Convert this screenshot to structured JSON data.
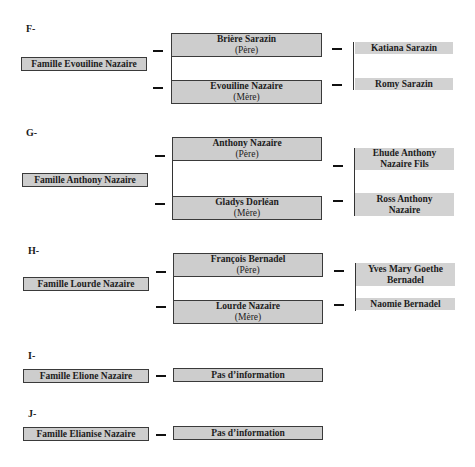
{
  "families": [
    {
      "letter": "F-",
      "family": "Famille Evouiline Nazaire",
      "father": {
        "name": "Brière Sarazin",
        "role": "(Père)"
      },
      "mother": {
        "name": "Evouiline Nazaire",
        "role": "(Mère)"
      },
      "children": [
        {
          "line1": "Katiana Sarazin",
          "line2": ""
        },
        {
          "line1": "Romy Sarazin",
          "line2": ""
        }
      ]
    },
    {
      "letter": "G-",
      "family": "Famille Anthony Nazaire",
      "father": {
        "name": "Anthony Nazaire",
        "role": "(Père)"
      },
      "mother": {
        "name": "Gladys Dorléan",
        "role": "(Mère)"
      },
      "children": [
        {
          "line1": "Ehude Anthony",
          "line2": "Nazaire Fils"
        },
        {
          "line1": "Ross Anthony",
          "line2": "Nazaire"
        }
      ]
    },
    {
      "letter": "H-",
      "family": "Famille Lourde Nazaire",
      "father": {
        "name": "François Bernadel",
        "role": "(Père)"
      },
      "mother": {
        "name": "Lourde Nazaire",
        "role": "(Mère)"
      },
      "children": [
        {
          "line1": "Yves Mary Goethe",
          "line2": "Bernadel"
        },
        {
          "line1": "Naomie Bernadel",
          "line2": ""
        }
      ]
    },
    {
      "letter": "I-",
      "family": "Famille Elione Nazaire",
      "info": "Pas d’information"
    },
    {
      "letter": "J-",
      "family": "Famille Elianise Nazaire",
      "info": "Pas d’information"
    }
  ],
  "colors": {
    "box_fill": "#cdcdcd",
    "border": "#3a3a3a",
    "background": "#ffffff"
  }
}
